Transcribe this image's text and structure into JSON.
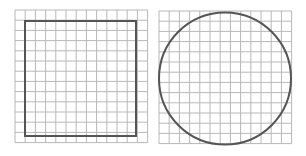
{
  "figure": {
    "width": 306,
    "height": 156,
    "background": "#ffffff",
    "grid_color": "#b8b8b8",
    "shape_color": "#555555"
  },
  "panels": [
    {
      "name": "square-panel",
      "grid": {
        "x": 15,
        "y": 10,
        "cols": 13,
        "rows": 13,
        "cell": 10.2
      },
      "shape": {
        "type": "square",
        "x": 25,
        "y": 21,
        "width": 111,
        "height": 115
      }
    },
    {
      "name": "circle-panel",
      "grid": {
        "x": 159,
        "y": 11,
        "cols": 13,
        "rows": 13,
        "cell": 10.2
      },
      "shape": {
        "type": "circle",
        "cx": 225,
        "cy": 78.5,
        "r": 66
      }
    }
  ]
}
